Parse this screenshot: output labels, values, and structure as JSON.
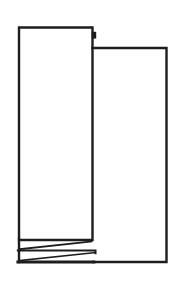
{
  "figure": {
    "background": "#ffffff",
    "ink": "#1d1d1d",
    "canvas": {
      "width": 179,
      "height": 284
    },
    "shapes": [
      {
        "name": "left-panel-outline",
        "d": "M 19 27.5 H 92.5 V 240 H 19 Z",
        "width": 2.4,
        "fill": "none"
      },
      {
        "name": "right-panel-outline",
        "d": "M 92.5 48 H 166.5 V 262 H 93",
        "width": 2.4,
        "fill": "none"
      },
      {
        "name": "left-edge-extension",
        "d": "M 19 239 V 262",
        "width": 2.4,
        "fill": "none"
      },
      {
        "name": "thread-band-bottom-line",
        "d": "M 17.8 262 H 94",
        "width": 2.8,
        "fill": "none"
      },
      {
        "name": "thread-band-middle-line",
        "d": "M 17.8 250.5 H 95.5 V 253.2",
        "width": 2.0,
        "fill": "none"
      },
      {
        "name": "upper-thread-diagonal",
        "d": "M 19.5 249.2 L 91.5 241.4",
        "width": 1.7,
        "fill": "none"
      },
      {
        "name": "lower-thread-diagonal",
        "d": "M 19.5 260.6 L 95 252.6",
        "width": 1.7,
        "fill": "none"
      },
      {
        "name": "top-step-notch",
        "d": "M 91.8 31.8 H 96.2 V 38.6 H 91.8 Z",
        "width": 0,
        "fill": "ink"
      }
    ]
  }
}
